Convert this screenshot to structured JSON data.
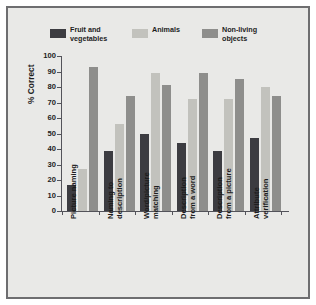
{
  "chart_data": {
    "type": "bar",
    "title": "",
    "xlabel": "",
    "ylabel": "% Correct",
    "ylim": [
      0,
      100
    ],
    "yticks": [
      0,
      10,
      20,
      30,
      40,
      50,
      60,
      70,
      80,
      90,
      100
    ],
    "grid": false,
    "legend_position": "top",
    "categories": [
      "Picture naming",
      "Naming to\ndescription",
      "Word/picture\nmatching",
      "Description\nfrom a word",
      "Description\nfrom a picture",
      "Attribute\nverification"
    ],
    "series": [
      {
        "name": "Fruit and\nvegetables",
        "color": "#3c3c41",
        "values": [
          17,
          39,
          50,
          44,
          39,
          47
        ]
      },
      {
        "name": "Animals",
        "color": "#c2c2bd",
        "values": [
          27,
          56,
          89,
          72,
          72,
          80
        ]
      },
      {
        "name": "Non-living\nobjects",
        "color": "#8e8e8c",
        "values": [
          93,
          74,
          81,
          89,
          85,
          74
        ]
      }
    ]
  },
  "figure": {
    "background_color": "#e9e9e7",
    "border_color": "#6e6e70",
    "axis_color": "#53535a",
    "text_color": "#1d1d1d"
  }
}
